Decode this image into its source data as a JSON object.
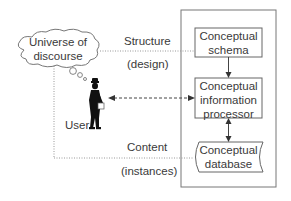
{
  "diagram": {
    "cloud": {
      "label_line1": "Universe of",
      "label_line2": "discourse"
    },
    "user": {
      "label": "User"
    },
    "structure": {
      "label": "Structure",
      "sublabel": "(design)"
    },
    "content": {
      "label": "Content",
      "sublabel": "(instances)"
    },
    "system": {
      "schema": {
        "line1": "Conceptual",
        "line2": "schema"
      },
      "processor": {
        "line1": "Conceptual",
        "line2": "information",
        "line3": "processor"
      },
      "database": {
        "line1": "Conceptual",
        "line2": "database"
      }
    },
    "colors": {
      "stroke": "#6b6b6b",
      "text": "#3a3a3a",
      "silhouette": "#111111",
      "dotted": "#9a9a9a"
    }
  }
}
